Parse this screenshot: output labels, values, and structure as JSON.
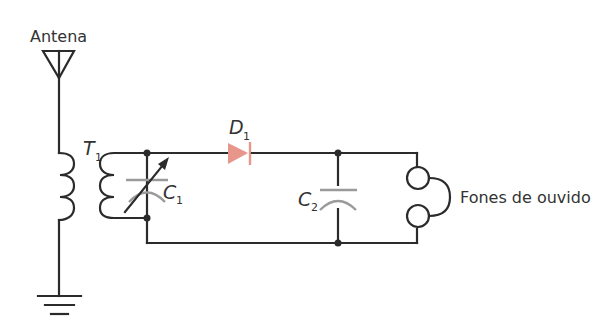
{
  "diagram": {
    "type": "crystal radio receiver circuit",
    "labels": {
      "antenna": "Antena",
      "transformer": "T",
      "transformer_sub": "1",
      "diode": "D",
      "diode_sub": "1",
      "capacitor1": "C",
      "capacitor1_sub": "1",
      "capacitor2": "C",
      "capacitor2_sub": "2",
      "earphones": "Fones de ouvido"
    },
    "components": [
      {
        "id": "antenna",
        "symbol": "antenna-icon"
      },
      {
        "id": "T1",
        "symbol": "transformer-coils"
      },
      {
        "id": "C1",
        "symbol": "variable-capacitor"
      },
      {
        "id": "D1",
        "symbol": "diode",
        "color": "#e8968c"
      },
      {
        "id": "C2",
        "symbol": "capacitor"
      },
      {
        "id": "earphones",
        "symbol": "earphone-icon"
      },
      {
        "id": "ground",
        "symbol": "ground-icon"
      }
    ],
    "colors": {
      "wire": "#2b2b2b",
      "capacitor_plates": "#9a9a9a",
      "diode": "#e8968c",
      "text": "#333333"
    }
  }
}
